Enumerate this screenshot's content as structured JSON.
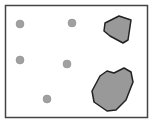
{
  "diagram": {
    "frame": {
      "x": 5.5,
      "y": 5.5,
      "width": 142,
      "height": 112,
      "stroke": "#444444",
      "fill": "#ffffff"
    },
    "circles": [
      {
        "cx": 20,
        "cy": 24,
        "r": 4,
        "fill": "#a0a0a0"
      },
      {
        "cx": 72,
        "cy": 23,
        "r": 4,
        "fill": "#a0a0a0"
      },
      {
        "cx": 20,
        "cy": 60,
        "r": 4,
        "fill": "#a0a0a0"
      },
      {
        "cx": 67,
        "cy": 64,
        "r": 4,
        "fill": "#a0a0a0"
      },
      {
        "cx": 47,
        "cy": 99,
        "r": 4,
        "fill": "#a0a0a0"
      }
    ],
    "polygons": [
      {
        "points": "105,23 119,16 131,20 128,40 123,43 110,36 104,31",
        "fill": "#999999",
        "stroke": "#222222"
      },
      {
        "points": "100,76 107,71 114,73 124,68 131,72 133,82 126,100 116,110 107,111 94,102 92,91",
        "fill": "#999999",
        "stroke": "#222222"
      }
    ]
  }
}
